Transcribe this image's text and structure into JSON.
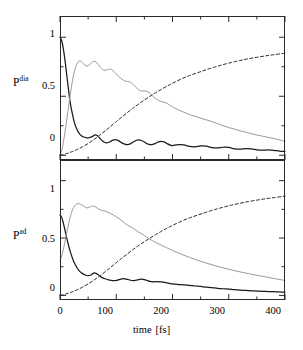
{
  "figure": {
    "width": 303,
    "height": 350,
    "background": "#ffffff",
    "axis_color": "#2a2a2a"
  },
  "xaxis": {
    "title_main": "time",
    "title_unit": "[fs]",
    "ticks": [
      "0",
      "100",
      "200",
      "300",
      "400"
    ],
    "range": [
      0,
      400
    ],
    "minor_step": 50
  },
  "panels": {
    "top": {
      "ylabel_base": "P",
      "ylabel_sup": "dia",
      "yticks": [
        "1",
        "0.5",
        "0"
      ],
      "ylim": [
        -0.04,
        1.18
      ]
    },
    "bottom": {
      "ylabel_base": "P",
      "ylabel_sup": "ad",
      "yticks": [
        "1",
        "0.5",
        "0"
      ],
      "ylim": [
        -0.04,
        1.18
      ]
    }
  },
  "series_style": {
    "solid_black": {
      "color": "#1a1a1a",
      "width": 1.25,
      "dash": "none"
    },
    "gray_thin": {
      "color": "#9a9a9a",
      "width": 1.0,
      "dash": "none"
    },
    "dashed": {
      "color": "#2a2a2a",
      "width": 1.0,
      "dash": "3,2.4"
    }
  },
  "chart_data": [
    {
      "type": "line",
      "title": "",
      "xlabel": "time [fs]",
      "ylabel": "P^dia",
      "xlim": [
        0,
        400
      ],
      "ylim": [
        -0.04,
        1.18
      ],
      "grid": false,
      "legend": "none",
      "series": [
        {
          "name": "solid-black-decay",
          "style": "solid_black",
          "x": [
            0,
            3,
            6,
            9,
            12,
            15,
            18,
            22,
            26,
            30,
            34,
            38,
            42,
            46,
            50,
            54,
            58,
            62,
            66,
            70,
            74,
            78,
            82,
            86,
            90,
            94,
            98,
            102,
            106,
            110,
            115,
            120,
            125,
            130,
            135,
            140,
            145,
            150,
            155,
            160,
            165,
            170,
            175,
            180,
            185,
            190,
            195,
            200,
            210,
            220,
            230,
            240,
            250,
            260,
            270,
            280,
            290,
            300,
            310,
            320,
            330,
            340,
            350,
            360,
            370,
            380,
            390,
            400
          ],
          "y": [
            1.0,
            0.97,
            0.9,
            0.8,
            0.68,
            0.56,
            0.45,
            0.35,
            0.27,
            0.22,
            0.185,
            0.165,
            0.155,
            0.15,
            0.148,
            0.152,
            0.16,
            0.172,
            0.168,
            0.15,
            0.128,
            0.112,
            0.105,
            0.108,
            0.118,
            0.128,
            0.132,
            0.128,
            0.118,
            0.105,
            0.094,
            0.09,
            0.097,
            0.112,
            0.125,
            0.13,
            0.125,
            0.112,
            0.098,
            0.09,
            0.092,
            0.102,
            0.113,
            0.118,
            0.113,
            0.1,
            0.088,
            0.082,
            0.09,
            0.088,
            0.075,
            0.072,
            0.08,
            0.078,
            0.065,
            0.062,
            0.068,
            0.066,
            0.055,
            0.052,
            0.056,
            0.054,
            0.046,
            0.043,
            0.045,
            0.042,
            0.036,
            0.032
          ]
        },
        {
          "name": "gray-rise-decay",
          "style": "gray_thin",
          "x": [
            0,
            4,
            8,
            12,
            16,
            20,
            24,
            28,
            32,
            36,
            40,
            44,
            48,
            52,
            56,
            60,
            64,
            68,
            72,
            76,
            80,
            84,
            88,
            92,
            96,
            100,
            105,
            110,
            115,
            120,
            125,
            130,
            135,
            140,
            145,
            150,
            155,
            160,
            165,
            170,
            175,
            180,
            185,
            190,
            195,
            200,
            210,
            220,
            230,
            240,
            250,
            260,
            270,
            280,
            290,
            300,
            310,
            320,
            330,
            340,
            350,
            360,
            370,
            380,
            390,
            400
          ],
          "y": [
            0.0,
            0.06,
            0.17,
            0.3,
            0.44,
            0.57,
            0.68,
            0.75,
            0.79,
            0.8,
            0.785,
            0.765,
            0.755,
            0.765,
            0.785,
            0.795,
            0.79,
            0.77,
            0.745,
            0.725,
            0.72,
            0.725,
            0.73,
            0.725,
            0.71,
            0.69,
            0.665,
            0.645,
            0.63,
            0.625,
            0.62,
            0.6,
            0.575,
            0.555,
            0.545,
            0.545,
            0.54,
            0.525,
            0.5,
            0.48,
            0.465,
            0.455,
            0.45,
            0.44,
            0.425,
            0.41,
            0.385,
            0.365,
            0.345,
            0.33,
            0.315,
            0.3,
            0.285,
            0.268,
            0.25,
            0.235,
            0.222,
            0.208,
            0.195,
            0.183,
            0.172,
            0.162,
            0.152,
            0.142,
            0.13,
            0.118
          ]
        },
        {
          "name": "dashed-rise",
          "style": "dashed",
          "x": [
            0,
            10,
            20,
            30,
            40,
            50,
            60,
            70,
            80,
            90,
            100,
            110,
            120,
            130,
            140,
            150,
            160,
            170,
            180,
            190,
            200,
            215,
            230,
            245,
            260,
            275,
            290,
            305,
            320,
            335,
            350,
            365,
            380,
            400
          ],
          "y": [
            0.0,
            0.012,
            0.028,
            0.048,
            0.072,
            0.1,
            0.132,
            0.168,
            0.205,
            0.245,
            0.285,
            0.325,
            0.363,
            0.4,
            0.435,
            0.468,
            0.5,
            0.53,
            0.558,
            0.585,
            0.61,
            0.645,
            0.675,
            0.7,
            0.725,
            0.748,
            0.768,
            0.787,
            0.803,
            0.818,
            0.83,
            0.842,
            0.852,
            0.865
          ]
        }
      ]
    },
    {
      "type": "line",
      "title": "",
      "xlabel": "time [fs]",
      "ylabel": "P^ad",
      "xlim": [
        0,
        400
      ],
      "ylim": [
        -0.04,
        1.18
      ],
      "grid": false,
      "legend": "none",
      "series": [
        {
          "name": "solid-black-decay",
          "style": "solid_black",
          "x": [
            0,
            3,
            6,
            9,
            12,
            16,
            20,
            24,
            28,
            32,
            36,
            40,
            45,
            50,
            55,
            60,
            65,
            70,
            75,
            80,
            85,
            90,
            95,
            100,
            105,
            110,
            115,
            120,
            125,
            130,
            135,
            140,
            145,
            150,
            155,
            160,
            165,
            170,
            180,
            190,
            200,
            210,
            220,
            230,
            240,
            250,
            260,
            270,
            280,
            290,
            300,
            310,
            320,
            330,
            340,
            350,
            360,
            370,
            380,
            390,
            400
          ],
          "y": [
            0.7,
            0.68,
            0.63,
            0.565,
            0.5,
            0.42,
            0.355,
            0.3,
            0.26,
            0.228,
            0.205,
            0.19,
            0.178,
            0.172,
            0.178,
            0.195,
            0.19,
            0.172,
            0.155,
            0.145,
            0.138,
            0.132,
            0.128,
            0.13,
            0.138,
            0.145,
            0.145,
            0.14,
            0.132,
            0.128,
            0.132,
            0.138,
            0.142,
            0.138,
            0.13,
            0.122,
            0.118,
            0.12,
            0.118,
            0.11,
            0.1,
            0.095,
            0.092,
            0.088,
            0.082,
            0.078,
            0.072,
            0.068,
            0.062,
            0.058,
            0.055,
            0.05,
            0.046,
            0.043,
            0.04,
            0.038,
            0.036,
            0.034,
            0.032,
            0.03,
            0.028
          ]
        },
        {
          "name": "gray-rise-decay",
          "style": "gray_thin",
          "x": [
            0,
            4,
            8,
            12,
            16,
            20,
            24,
            28,
            32,
            36,
            40,
            44,
            48,
            52,
            56,
            60,
            64,
            68,
            72,
            76,
            80,
            85,
            90,
            95,
            100,
            105,
            110,
            115,
            120,
            125,
            130,
            135,
            140,
            145,
            150,
            155,
            160,
            170,
            180,
            190,
            200,
            215,
            230,
            245,
            260,
            275,
            290,
            305,
            320,
            335,
            350,
            365,
            380,
            400
          ],
          "y": [
            0.3,
            0.36,
            0.45,
            0.545,
            0.64,
            0.715,
            0.765,
            0.79,
            0.8,
            0.795,
            0.785,
            0.772,
            0.762,
            0.768,
            0.778,
            0.778,
            0.768,
            0.755,
            0.745,
            0.74,
            0.735,
            0.725,
            0.715,
            0.7,
            0.685,
            0.67,
            0.65,
            0.63,
            0.612,
            0.6,
            0.585,
            0.568,
            0.552,
            0.538,
            0.522,
            0.505,
            0.49,
            0.462,
            0.438,
            0.415,
            0.392,
            0.36,
            0.332,
            0.305,
            0.282,
            0.26,
            0.24,
            0.222,
            0.205,
            0.19,
            0.175,
            0.162,
            0.148,
            0.13
          ]
        },
        {
          "name": "dashed-rise",
          "style": "dashed",
          "x": [
            0,
            10,
            20,
            30,
            40,
            50,
            60,
            70,
            80,
            90,
            100,
            110,
            120,
            130,
            140,
            150,
            160,
            170,
            180,
            190,
            200,
            215,
            230,
            245,
            260,
            275,
            290,
            305,
            320,
            335,
            350,
            365,
            380,
            400
          ],
          "y": [
            0.0,
            0.012,
            0.028,
            0.048,
            0.072,
            0.1,
            0.132,
            0.168,
            0.205,
            0.245,
            0.285,
            0.325,
            0.363,
            0.4,
            0.435,
            0.468,
            0.5,
            0.53,
            0.558,
            0.585,
            0.61,
            0.645,
            0.675,
            0.7,
            0.725,
            0.748,
            0.768,
            0.787,
            0.803,
            0.818,
            0.83,
            0.842,
            0.852,
            0.865
          ]
        }
      ]
    }
  ]
}
